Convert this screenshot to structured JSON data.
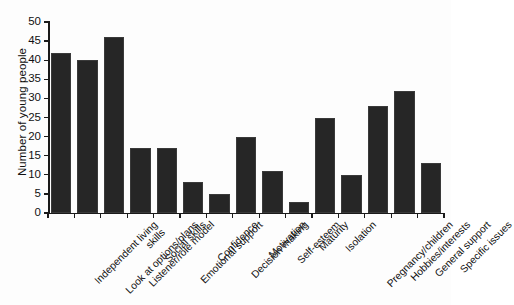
{
  "chart_data": {
    "type": "bar",
    "title": "",
    "xlabel": "",
    "ylabel": "Number of young people",
    "ylim": [
      0,
      50
    ],
    "ytick_step": 5,
    "yticks": [
      "0",
      "5",
      "10",
      "15",
      "20",
      "25",
      "30",
      "35",
      "40",
      "45",
      "50"
    ],
    "grid": false,
    "legend": "none",
    "bar_color": "#262626",
    "axis_color": "#1a1a1a",
    "categories": [
      "Independent living skills",
      "Look at options/plans",
      "Listener/role model",
      "Social skills",
      "Emotional support",
      "Confidence",
      "Decision making",
      "Motivation",
      "Self-esteem",
      "Maturity",
      "Isolation",
      "Pregnancy/children",
      "Hobbies/interests",
      "General support",
      "Specific issues"
    ],
    "category_lines": [
      [
        "Independent living",
        "skills"
      ],
      [
        "Look at options/plans"
      ],
      [
        "Listener/role model"
      ],
      [
        "Social skills"
      ],
      [
        "Emotional support"
      ],
      [
        "Confidence"
      ],
      [
        "Decision making"
      ],
      [
        "Motivation"
      ],
      [
        "Self-esteem"
      ],
      [
        "Maturity"
      ],
      [
        "Isolation"
      ],
      [
        "Pregnancy/children"
      ],
      [
        "Hobbies/interests"
      ],
      [
        "General support"
      ],
      [
        "Specific issues"
      ]
    ],
    "values": [
      42,
      40,
      46,
      17,
      17,
      8,
      5,
      20,
      11,
      3,
      25,
      10,
      28,
      32,
      13
    ]
  }
}
